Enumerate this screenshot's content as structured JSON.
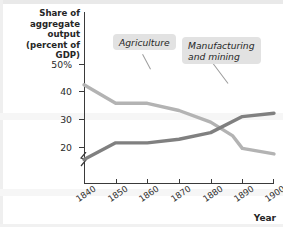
{
  "chart_data": {
    "type": "line",
    "title": "",
    "subtitle": "",
    "ylabel": "Share of aggregate output (percent of GDP)",
    "xlabel": "Year",
    "x": [
      1840,
      1850,
      1860,
      1870,
      1880,
      1890,
      1900
    ],
    "xtick_labels": [
      "1840",
      "1850",
      "1860",
      "1870",
      "1880",
      "1890",
      "1900"
    ],
    "ytick_labels": [
      "50%",
      "40",
      "30",
      "20"
    ],
    "ytick_values": [
      50,
      40,
      30,
      20
    ],
    "ylim": [
      13,
      53
    ],
    "xlim": [
      1840,
      1900
    ],
    "grid": false,
    "axis_break": true,
    "legend_position": "inline-callouts",
    "series": [
      {
        "name": "Agriculture",
        "color": "#b3b3b3",
        "x": [
          1840,
          1850,
          1860,
          1870,
          1880,
          1887,
          1890,
          1900
        ],
        "values": [
          42.5,
          35.8,
          35.8,
          33.2,
          29.0,
          24.0,
          19.5,
          17.5
        ]
      },
      {
        "name": "Manufacturing and mining",
        "color": "#808080",
        "x": [
          1840,
          1850,
          1860,
          1870,
          1880,
          1890,
          1900
        ],
        "values": [
          15.5,
          21.5,
          21.5,
          22.8,
          25.2,
          31.0,
          32.2
        ]
      }
    ],
    "annotations": [
      {
        "text": "Agriculture",
        "target_series": "Agriculture"
      },
      {
        "text": "Manufacturing\nand mining",
        "target_series": "Manufacturing and mining"
      }
    ]
  },
  "axis": {
    "y_title": "Share of\naggregate\noutput (percent\nof GDP)",
    "x_title": "Year",
    "y_ticks": [
      {
        "label": "50%",
        "value": 50
      },
      {
        "label": "40",
        "value": 40
      },
      {
        "label": "30",
        "value": 30
      },
      {
        "label": "20",
        "value": 20
      }
    ],
    "x_ticks": [
      {
        "label": "1840",
        "value": 1840
      },
      {
        "label": "1850",
        "value": 1850
      },
      {
        "label": "1860",
        "value": 1860
      },
      {
        "label": "1870",
        "value": 1870
      },
      {
        "label": "1880",
        "value": 1880
      },
      {
        "label": "1890",
        "value": 1890
      },
      {
        "label": "1900",
        "value": 1900
      }
    ]
  },
  "callouts": {
    "agriculture": "Agriculture",
    "manufacturing": "Manufacturing\nand mining"
  }
}
